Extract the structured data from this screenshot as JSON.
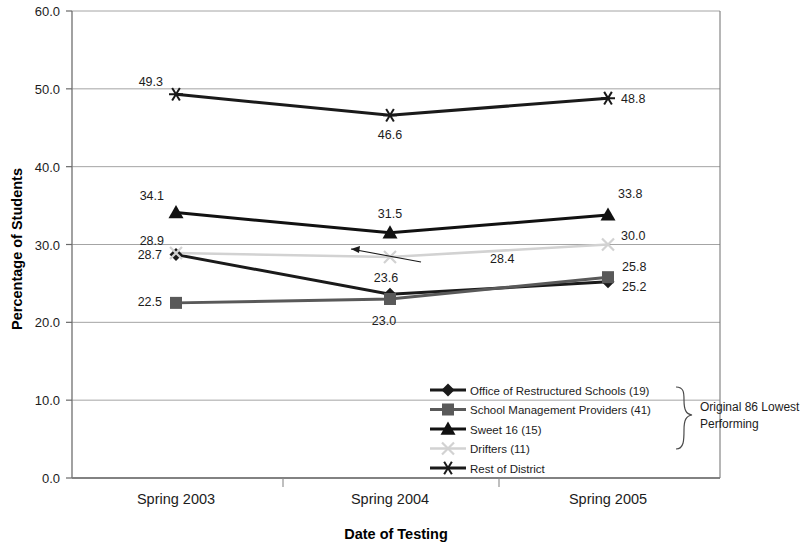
{
  "chart_data": {
    "type": "line",
    "title": "",
    "xlabel": "Date of Testing",
    "ylabel": "Percentage of Students",
    "categories": [
      "Spring 2003",
      "Spring 2004",
      "Spring 2005"
    ],
    "ylim": [
      0.0,
      60.0
    ],
    "yticks": [
      "0.0",
      "10.0",
      "20.0",
      "30.0",
      "40.0",
      "50.0",
      "60.0"
    ],
    "ytick_values": [
      0.0,
      10.0,
      20.0,
      30.0,
      40.0,
      50.0,
      60.0
    ],
    "grid": true,
    "legend_position": "inside-bottom-right",
    "series": [
      {
        "name": "Office of Restructured Schools (19)",
        "marker": "diamond",
        "color": "#1a1a1a",
        "values": [
          28.7,
          23.6,
          25.2
        ],
        "labels": [
          "28.7",
          "23.6",
          "25.2"
        ]
      },
      {
        "name": "School Management Providers (41)",
        "marker": "square",
        "color": "#595959",
        "values": [
          22.5,
          23.0,
          25.8
        ],
        "labels": [
          "22.5",
          "23.0",
          "25.8"
        ]
      },
      {
        "name": "Sweet 16 (15)",
        "marker": "triangle",
        "color": "#111111",
        "values": [
          34.1,
          31.5,
          33.8
        ],
        "labels": [
          "34.1",
          "31.5",
          "33.8"
        ]
      },
      {
        "name": "Drifters (11)",
        "marker": "cross",
        "color": "#d2d2d2",
        "values": [
          28.9,
          28.4,
          30.0
        ],
        "labels": [
          "28.9",
          "28.4",
          "30.0"
        ]
      },
      {
        "name": "Rest of District",
        "marker": "asterisk",
        "color": "#1a1a1a",
        "values": [
          49.3,
          46.6,
          48.8
        ],
        "labels": [
          "49.3",
          "46.6",
          "48.8"
        ]
      }
    ],
    "annotations": [
      {
        "text": "28.4",
        "note": "leader line pointing to Drifters Spring 2004 point"
      }
    ],
    "bracket_label": "Original 86 Lowest Performing",
    "bracket_label_line1": "Original 86 Lowest",
    "bracket_label_line2": "Performing"
  },
  "axis": {
    "y_title": "Percentage of Students",
    "x_title": "Date of Testing"
  },
  "legend": {
    "items": [
      {
        "label": "Office of Restructured Schools (19)"
      },
      {
        "label": "School Management Providers (41)"
      },
      {
        "label": "Sweet 16 (15)"
      },
      {
        "label": "Drifters (11)"
      },
      {
        "label": "Rest of District"
      }
    ]
  }
}
